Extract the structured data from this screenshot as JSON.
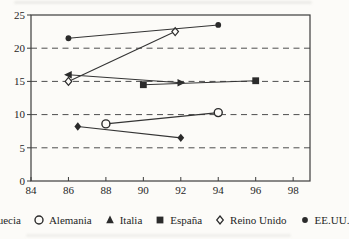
{
  "figure": {
    "background": "#fcfbf8",
    "ink": "#2b2b2b",
    "grid_color": "#4d4d4d"
  },
  "chart_data": {
    "type": "scatter",
    "title": "",
    "xlabel": "",
    "ylabel": "",
    "xlim": [
      84,
      98.9
    ],
    "ylim": [
      0,
      25
    ],
    "xticks": [
      84,
      86,
      88,
      90,
      92,
      94,
      96,
      98
    ],
    "yticks": [
      0,
      5,
      10,
      15,
      20,
      25
    ],
    "grid_yticks": [
      5,
      10,
      15,
      20
    ],
    "grid": "dashed-horizontal",
    "legend_position": "bottom",
    "series": [
      {
        "name": "Suecia",
        "marker": "diamond-filled",
        "points": [
          [
            86.5,
            8.2
          ],
          [
            92,
            6.5
          ]
        ]
      },
      {
        "name": "Alemania",
        "marker": "circle-open",
        "points": [
          [
            88,
            8.6
          ],
          [
            94,
            10.3
          ]
        ]
      },
      {
        "name": "Italia",
        "marker": "triangle-filled",
        "marker_angles": [
          270,
          90
        ],
        "points": [
          [
            86,
            16
          ],
          [
            92,
            14.8
          ]
        ]
      },
      {
        "name": "España",
        "marker": "square-filled",
        "points": [
          [
            90,
            14.5
          ],
          [
            96,
            15.1
          ]
        ]
      },
      {
        "name": "Reino Unido",
        "marker": "diamond-open",
        "points": [
          [
            86,
            15
          ],
          [
            91.7,
            22.5
          ]
        ]
      },
      {
        "name": "EE.UU.",
        "marker": "circle-filled",
        "points": [
          [
            86,
            21.5
          ],
          [
            94,
            23.5
          ]
        ]
      }
    ]
  }
}
